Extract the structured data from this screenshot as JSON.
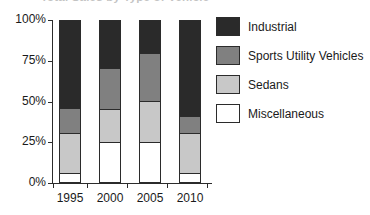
{
  "chart_data": {
    "type": "bar",
    "subtype": "100% stacked bar",
    "title": "Total Sales by Type of Vehicle",
    "title_clipped": true,
    "xlabel": "",
    "ylabel": "",
    "categories": [
      "1995",
      "2000",
      "2005",
      "2010"
    ],
    "ylim": [
      0,
      100
    ],
    "ytick_labels": [
      "0%",
      "25%",
      "50%",
      "75%",
      "100%"
    ],
    "ytick_values": [
      0,
      25,
      50,
      75,
      100
    ],
    "grid": false,
    "legend_position": "right",
    "stack_order_bottom_to_top": [
      "Miscellaneous",
      "Sedans",
      "Sports Utility Vehicles",
      "Industrial"
    ],
    "series": [
      {
        "name": "Industrial",
        "color": "#2a2a2a",
        "values": [
          55,
          30,
          20,
          60
        ]
      },
      {
        "name": "Sports Utility Vehicles",
        "color": "#808080",
        "values": [
          15,
          25,
          30,
          10
        ]
      },
      {
        "name": "Sedans",
        "color": "#c8c8c8",
        "values": [
          25,
          20,
          25,
          25
        ]
      },
      {
        "name": "Miscellaneous",
        "color": "#ffffff",
        "values": [
          5,
          25,
          25,
          5
        ]
      }
    ],
    "cumulative_tops": {
      "1995": {
        "Miscellaneous": 5,
        "Sedans": 30,
        "Sports Utility Vehicles": 45,
        "Industrial": 100
      },
      "2000": {
        "Miscellaneous": 25,
        "Sedans": 45,
        "Sports Utility Vehicles": 70,
        "Industrial": 100
      },
      "2005": {
        "Miscellaneous": 25,
        "Sedans": 50,
        "Sports Utility Vehicles": 80,
        "Industrial": 100
      },
      "2010": {
        "Miscellaneous": 5,
        "Sedans": 30,
        "Sports Utility Vehicles": 40,
        "Industrial": 100
      }
    }
  },
  "axis": {
    "y_labels": [
      "100%",
      "75%",
      "50%",
      "25%",
      "0%"
    ],
    "x_labels": [
      "1995",
      "2000",
      "2005",
      "2010"
    ]
  },
  "legend": {
    "items": [
      {
        "label": "Industrial",
        "color": "#2a2a2a"
      },
      {
        "label": "Sports Utility Vehicles",
        "color": "#808080"
      },
      {
        "label": "Sedans",
        "color": "#c8c8c8"
      },
      {
        "label": "Miscellaneous",
        "color": "#ffffff"
      }
    ]
  }
}
